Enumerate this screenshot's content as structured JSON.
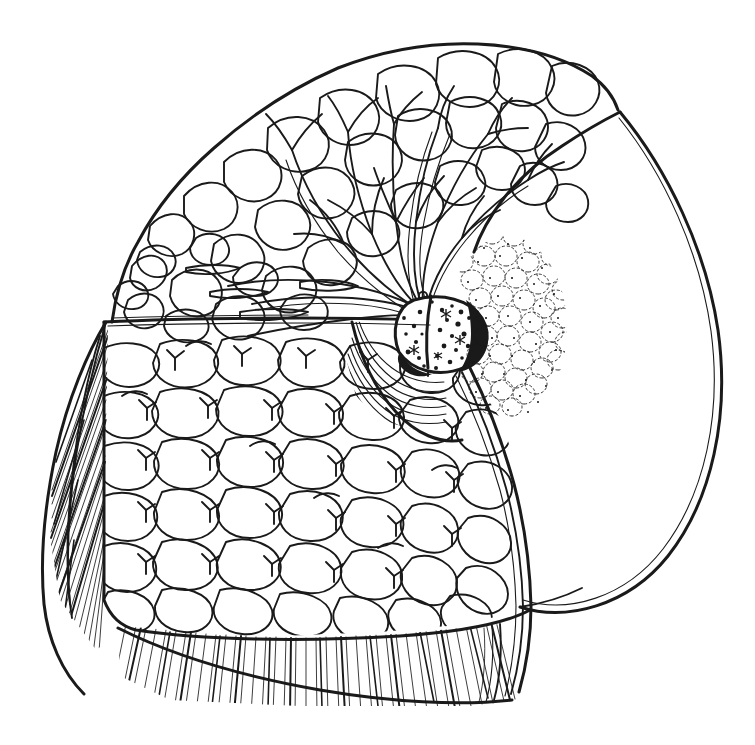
{
  "figure": {
    "kind": "anatomical-line-drawing",
    "style": "pen-and-ink hatching, black line art on white",
    "canvas": {
      "width": 755,
      "height": 745
    },
    "background_color": "#ffffff",
    "ink_color": "#1a1a1a",
    "caption": "",
    "title": "",
    "labels": []
  },
  "regions": [
    {
      "id": "glandular-lobes",
      "name": "Glandular lobes (mammary gland tissue)",
      "description": "Upper fan of cauliflower-like lobules filling the superior wedge of the cut surface",
      "texture": "lobulated outlines",
      "bbox": [
        108,
        38,
        610,
        330
      ]
    },
    {
      "id": "lactiferous-duct-tree",
      "name": "Lactiferous duct tree",
      "description": "Branching ducts radiating from the nipple base out into the lobules",
      "texture": "tapering double-line branches",
      "bbox": [
        150,
        80,
        430,
        320
      ]
    },
    {
      "id": "duct-orifices",
      "name": "Lactiferous duct orifices",
      "description": "Small open circles clustered where ducts converge at the nipple base",
      "count": 8,
      "bbox": [
        405,
        290,
        440,
        320
      ]
    },
    {
      "id": "nipple",
      "name": "Nipple",
      "description": "Dark stippled ovoid at the apex of the areola, split by the sectioning plane",
      "texture": "dense stipple with heavy outline",
      "bbox": [
        400,
        292,
        490,
        370
      ]
    },
    {
      "id": "areola",
      "name": "Areola with Montgomery glands",
      "description": "Bumpy stippled disc surrounding the nipple on the intact skin surface",
      "texture": "dotted scalloped bumps",
      "bbox": [
        455,
        235,
        565,
        420
      ]
    },
    {
      "id": "subareolar-muscle",
      "name": "Subareolar smooth muscle / lactiferous sinuses",
      "description": "Concentric arc lines beneath the areola",
      "texture": "concentric arcs",
      "bbox": [
        345,
        320,
        480,
        420
      ]
    },
    {
      "id": "adipose-tissue",
      "name": "Adipose (fatty) tissue",
      "description": "Large field of rounded fat lobules filling the inferior cut surface",
      "texture": "packed rounded cells",
      "bbox": [
        100,
        320,
        535,
        640
      ]
    },
    {
      "id": "pectoral-muscle",
      "name": "Pectoral muscle / chest wall",
      "description": "Directional hatched band along the bottom and left-hand cut edges",
      "texture": "parallel directional hatching",
      "bbox": [
        40,
        400,
        545,
        710
      ]
    },
    {
      "id": "skin-profile",
      "name": "Skin surface profile",
      "description": "Large smooth arc sweeping from the upper peak down to the inframammary fold",
      "texture": "single heavy contour with thin inner parallel",
      "bbox": [
        495,
        108,
        722,
        612
      ]
    },
    {
      "id": "inframammary-fold",
      "name": "Inframammary fold",
      "description": "Where the skin contour meets the chest wall at lower right",
      "bbox": [
        495,
        585,
        560,
        700
      ]
    }
  ],
  "geometry": {
    "skin_arc": {
      "apex": [
        620,
        112
      ],
      "bulge_x": 722,
      "bottom": [
        520,
        607
      ]
    },
    "gland_fat_boundary_y": 320,
    "nipple_center": [
      445,
      330
    ],
    "areola_center": [
      505,
      328
    ],
    "areola_radius": 58
  },
  "counts": {
    "fat_lobules_approx": 240,
    "gland_lobules_approx": 90,
    "duct_branches_approx": 34,
    "hatch_strokes_approx": 520
  }
}
